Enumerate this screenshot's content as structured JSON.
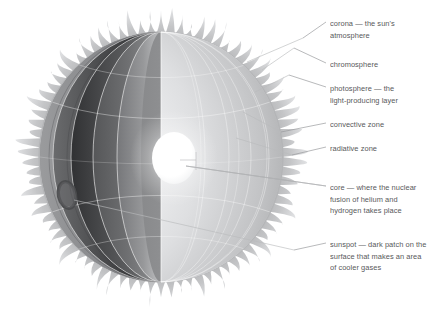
{
  "figure": {
    "background_color": "#ffffff",
    "text_color": "#58595b",
    "leader_line_color": "#9a9b9d"
  },
  "labels": [
    {
      "id": "corona",
      "name": "corona",
      "lines": [
        "corona — the sun's",
        "atmosphere"
      ],
      "x": 330,
      "y": 18,
      "leader": {
        "x1": 303,
        "y1": 38,
        "x2": 326,
        "y2": 22
      },
      "anchor": {
        "x": 247,
        "y": 62
      }
    },
    {
      "id": "chromosphere",
      "name": "chromosphere",
      "lines": [
        "chromosphere"
      ],
      "x": 330,
      "y": 59,
      "leader": {
        "x1": 294,
        "y1": 48,
        "x2": 326,
        "y2": 63
      },
      "anchor": {
        "x": 262,
        "y": 70
      }
    },
    {
      "id": "photosphere",
      "name": "photosphere",
      "lines": [
        "photosphere — the",
        "light-producing layer"
      ],
      "x": 330,
      "y": 83,
      "leader": {
        "x1": 289,
        "y1": 75,
        "x2": 326,
        "y2": 87
      },
      "anchor": {
        "x": 255,
        "y": 92
      }
    },
    {
      "id": "convective-zone",
      "name": "convective zone",
      "lines": [
        "convective zone"
      ],
      "x": 330,
      "y": 119,
      "leader": {
        "x1": 281,
        "y1": 132,
        "x2": 326,
        "y2": 123
      },
      "anchor": {
        "x": 243,
        "y": 112
      }
    },
    {
      "id": "radiative-zone",
      "name": "radiative zone",
      "lines": [
        "radiative zone"
      ],
      "x": 330,
      "y": 143,
      "leader": {
        "x1": 292,
        "y1": 155,
        "x2": 326,
        "y2": 147
      },
      "anchor": {
        "x": 236,
        "y": 138
      }
    },
    {
      "id": "core",
      "name": "core",
      "lines": [
        "core — where the nuclear",
        "fusion of helium and",
        "hydrogen takes place"
      ],
      "x": 330,
      "y": 182,
      "leader": {
        "x1": 186,
        "y1": 166,
        "x2": 326,
        "y2": 186
      },
      "anchor": {
        "x": 186,
        "y": 166
      }
    },
    {
      "id": "sunspot",
      "name": "sunspot",
      "lines": [
        "sunspot — dark patch on the",
        "surface that makes an area",
        "of cooler gases"
      ],
      "x": 330,
      "y": 239,
      "leader": {
        "x1": 294,
        "y1": 250,
        "x2": 326,
        "y2": 243
      },
      "anchor": {
        "x": 74,
        "y": 200
      }
    }
  ],
  "sun": {
    "center": {
      "x": 161,
      "y": 157
    },
    "body_radius_x": 129,
    "body_radius_y": 132,
    "corona": {
      "name": "corona-spikes",
      "spike_count": 82,
      "inner_radius_scale": 0.935,
      "outer_radius_scale": 1.0,
      "color_outer": "#cfd0d1",
      "color_inner": "#8d8e90"
    },
    "core": {
      "name": "core-sphere",
      "cx": 174,
      "cy": 158,
      "rx": 22,
      "ry": 26,
      "color": "#ffffff"
    },
    "sunspot": {
      "name": "sunspot-mark",
      "cx": 67,
      "cy": 195,
      "rx": 8,
      "ry": 13,
      "rotation": -12,
      "color": "#4d4e50"
    },
    "shells": [
      {
        "id": "photosphere",
        "label": "photosphere",
        "rx_scale": 0.935,
        "color_left": "#7b7c7e",
        "color_right": "#e9eaec"
      },
      {
        "id": "chromosphere",
        "label": "chromosphere",
        "rx_scale": 0.885,
        "color_left": "#6d6e70",
        "color_right": "#e2e3e5"
      },
      {
        "id": "convective",
        "label": "convective zone",
        "rx_scale": 0.8,
        "color_left": "#2f3031",
        "color_right": "#d9dadc"
      },
      {
        "id": "radiative",
        "label": "radiative zone",
        "rx_scale": 0.7,
        "color_left": "#6a6b6d",
        "color_right": "#cfd0d2"
      }
    ],
    "grid": {
      "name": "surface-grid",
      "color": "#ffffff",
      "meridian_count": 5,
      "parallel_count": 5
    }
  }
}
